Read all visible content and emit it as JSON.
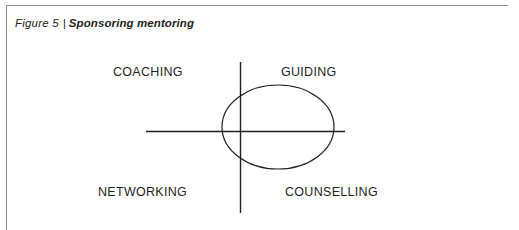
{
  "figure": {
    "caption": {
      "label": "Figure 5",
      "separator": "|",
      "title": "Sponsoring mentoring"
    },
    "colors": {
      "frame": "#8c8c8c",
      "stroke": "#231f20",
      "background": "#ffffff",
      "text": "#231f20"
    },
    "diagram": {
      "type": "quadrant-with-ellipse",
      "vertical_axis": {
        "x": 240,
        "y1": 62,
        "y2": 213
      },
      "horizontal_axis": {
        "y": 131,
        "x1": 146,
        "x2": 345
      },
      "ellipse": {
        "cx": 278,
        "cy": 127,
        "rx": 56,
        "ry": 42
      },
      "quadrant_labels": {
        "top_left": "COACHING",
        "top_right": "GUIDING",
        "bottom_left": "NETWORKING",
        "bottom_right": "COUNSELLING"
      }
    }
  }
}
